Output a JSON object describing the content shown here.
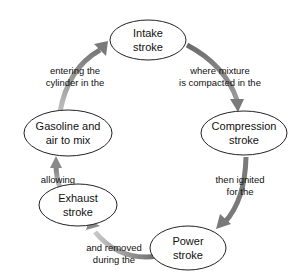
{
  "diagram": {
    "arrow_color": "#888888",
    "nodes": [
      {
        "id": "intake",
        "line1": "Intake",
        "line2": "stroke"
      },
      {
        "id": "compression",
        "line1": "Compression",
        "line2": "stroke"
      },
      {
        "id": "power",
        "line1": "Power",
        "line2": "stroke"
      },
      {
        "id": "exhaust",
        "line1": "Exhaust",
        "line2": "stroke"
      },
      {
        "id": "gasoline",
        "line1": "Gasoline and",
        "line2": "air to mix"
      }
    ],
    "edges": [
      {
        "from": "intake",
        "to": "compression",
        "line1": "where mixture",
        "line2": "is compacted in the"
      },
      {
        "from": "compression",
        "to": "power",
        "line1": "then ignited",
        "line2": "for the"
      },
      {
        "from": "power",
        "to": "exhaust",
        "line1": "and removed",
        "line2": "during the"
      },
      {
        "from": "exhaust",
        "to": "gasoline",
        "line1": "allowing",
        "line2": ""
      },
      {
        "from": "gasoline",
        "to": "intake",
        "line1": "entering the",
        "line2": "cylinder in the"
      }
    ]
  }
}
